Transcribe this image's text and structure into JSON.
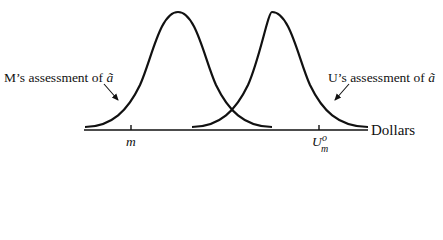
{
  "diagram": {
    "type": "two-bell-curves",
    "axis": {
      "label": "Dollars"
    },
    "ticks": [
      {
        "id": "m",
        "label": "m",
        "x": 131
      },
      {
        "id": "U_m_o",
        "label": "U",
        "superscript": "o",
        "subscript": "m",
        "x": 319
      }
    ],
    "curves": [
      {
        "id": "M",
        "label_prefix": "M’s assessment of ",
        "variable": "ã",
        "peak_x": 178
      },
      {
        "id": "U",
        "label_prefix": "U’s assessment of ",
        "variable": "ã",
        "peak_x": 272
      }
    ],
    "colors": {
      "stroke": "#111111",
      "background": "#ffffff"
    }
  }
}
